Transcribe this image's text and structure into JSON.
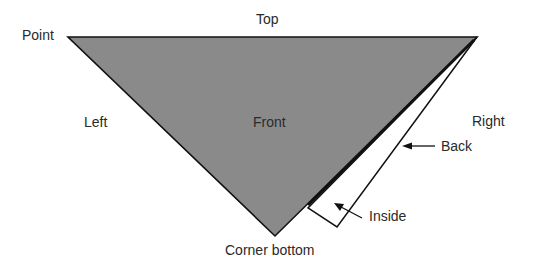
{
  "diagram": {
    "type": "folded triangle (scarf/bandage) parts",
    "colors": {
      "front_fill": "#8a8a8a",
      "stroke": "#111111",
      "back_fill": "#ffffff",
      "text": "#2a2a2a"
    },
    "labels": {
      "top": "Top",
      "point": "Point",
      "left": "Left",
      "front": "Front",
      "right": "Right",
      "back": "Back",
      "inside": "Inside",
      "corner_bottom": "Corner bottom"
    }
  }
}
